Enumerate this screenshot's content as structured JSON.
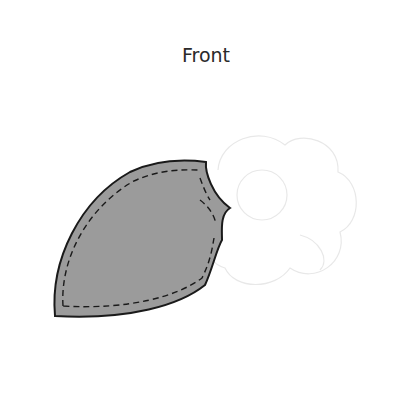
{
  "title": "Front",
  "colors": {
    "petal_fill": "#9a9a9a",
    "petal_stroke": "#1a1a1a",
    "stitch": "#1a1a1a",
    "ghost_outline": "#e6e6e6",
    "background": "#ffffff"
  },
  "shapes": {
    "petal": "filled petal with dashed stitch line",
    "ghost_flower": "faint outline of flower with circular petals and center"
  }
}
